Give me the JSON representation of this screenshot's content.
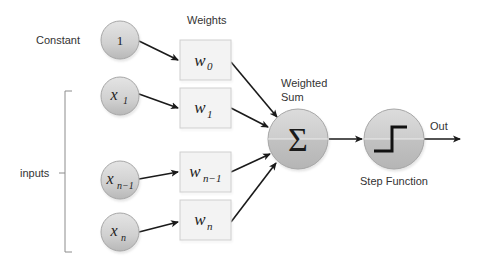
{
  "diagram": {
    "labels": {
      "constant": "Constant",
      "weights": "Weights",
      "inputs": "inputs",
      "weighted_sum_line1": "Weighted",
      "weighted_sum_line2": "Sum",
      "step_function": "Step Function",
      "out": "Out"
    },
    "input_nodes": [
      {
        "var": "1",
        "sub": ""
      },
      {
        "var": "x",
        "sub": "1"
      },
      {
        "var": "x",
        "sub": "n−1"
      },
      {
        "var": "x",
        "sub": "n"
      }
    ],
    "weight_nodes": [
      {
        "var": "w",
        "sub": "0"
      },
      {
        "var": "w",
        "sub": "1"
      },
      {
        "var": "w",
        "sub": "n−1"
      },
      {
        "var": "w",
        "sub": "n"
      }
    ],
    "sum_node": {
      "symbol": "Σ"
    },
    "step_node": {
      "icon": "step-function-icon"
    },
    "colors": {
      "node_fill_top": "#d9d9d9",
      "node_fill_bottom": "#bfbfbf",
      "node_stroke": "#a6a6a6",
      "box_fill": "#f2f2f2",
      "box_stroke": "#cfcfcf",
      "arrow": "#1a1a1a"
    }
  }
}
